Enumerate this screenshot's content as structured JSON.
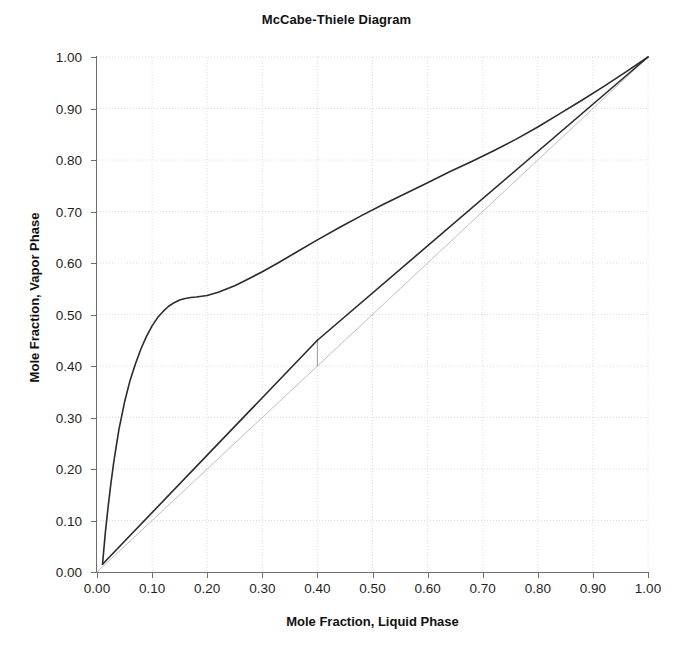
{
  "chart_data": {
    "type": "line",
    "title": "McCabe-Thiele Diagram",
    "xlabel": "Mole Fraction, Liquid Phase",
    "ylabel": "Mole Fraction, Vapor Phase",
    "xlim": [
      0.0,
      1.0
    ],
    "ylim": [
      0.0,
      1.0
    ],
    "xticks": [
      "0.00",
      "0.10",
      "0.20",
      "0.30",
      "0.40",
      "0.50",
      "0.60",
      "0.70",
      "0.80",
      "0.90",
      "1.00"
    ],
    "yticks": [
      "0.00",
      "0.10",
      "0.20",
      "0.30",
      "0.40",
      "0.50",
      "0.60",
      "0.70",
      "0.80",
      "0.90",
      "1.00"
    ],
    "xtick_values": [
      0.0,
      0.1,
      0.2,
      0.3,
      0.4,
      0.5,
      0.6,
      0.7,
      0.8,
      0.9,
      1.0
    ],
    "ytick_values": [
      0.0,
      0.1,
      0.2,
      0.3,
      0.4,
      0.5,
      0.6,
      0.7,
      0.8,
      0.9,
      1.0
    ],
    "grid": true,
    "grid_style": "dotted",
    "grid_color": "#dcdcdc",
    "legend": "none",
    "axis_color": "#6e6e6e",
    "series": [
      {
        "name": "equilibrium-curve",
        "role": "vapor-liquid equilibrium curve",
        "color": "#2b2b2b",
        "width": 1.6,
        "points": [
          [
            0.01,
            0.015
          ],
          [
            0.015,
            0.075
          ],
          [
            0.02,
            0.125
          ],
          [
            0.025,
            0.17
          ],
          [
            0.03,
            0.21
          ],
          [
            0.035,
            0.245
          ],
          [
            0.04,
            0.278
          ],
          [
            0.05,
            0.33
          ],
          [
            0.06,
            0.372
          ],
          [
            0.07,
            0.405
          ],
          [
            0.08,
            0.434
          ],
          [
            0.09,
            0.458
          ],
          [
            0.1,
            0.478
          ],
          [
            0.11,
            0.494
          ],
          [
            0.12,
            0.506
          ],
          [
            0.13,
            0.516
          ],
          [
            0.14,
            0.523
          ],
          [
            0.15,
            0.528
          ],
          [
            0.16,
            0.531
          ],
          [
            0.17,
            0.533
          ],
          [
            0.18,
            0.534
          ],
          [
            0.2,
            0.537
          ],
          [
            0.22,
            0.543
          ],
          [
            0.25,
            0.556
          ],
          [
            0.28,
            0.572
          ],
          [
            0.3,
            0.583
          ],
          [
            0.33,
            0.601
          ],
          [
            0.36,
            0.62
          ],
          [
            0.4,
            0.645
          ],
          [
            0.44,
            0.669
          ],
          [
            0.48,
            0.692
          ],
          [
            0.52,
            0.714
          ],
          [
            0.56,
            0.735
          ],
          [
            0.6,
            0.756
          ],
          [
            0.64,
            0.777
          ],
          [
            0.68,
            0.797
          ],
          [
            0.72,
            0.818
          ],
          [
            0.76,
            0.84
          ],
          [
            0.8,
            0.864
          ],
          [
            0.84,
            0.89
          ],
          [
            0.88,
            0.916
          ],
          [
            0.92,
            0.943
          ],
          [
            0.96,
            0.971
          ],
          [
            1.0,
            1.0
          ]
        ]
      },
      {
        "name": "operating-line-rectifying",
        "role": "rectifying section operating line",
        "color": "#2b2b2b",
        "width": 1.6,
        "points": [
          [
            0.4,
            0.45
          ],
          [
            1.0,
            1.0
          ]
        ]
      },
      {
        "name": "operating-line-stripping",
        "role": "stripping section operating line",
        "color": "#2b2b2b",
        "width": 1.6,
        "points": [
          [
            0.01,
            0.015
          ],
          [
            0.4,
            0.45
          ]
        ]
      },
      {
        "name": "q-line",
        "role": "feed q-line segment",
        "color": "#9a9a9a",
        "width": 1.0,
        "points": [
          [
            0.4,
            0.4
          ],
          [
            0.4,
            0.45
          ]
        ]
      },
      {
        "name": "diagonal-45",
        "role": "y = x forty-five degree reference line",
        "color": "#bfbfbf",
        "width": 1.0,
        "points": [
          [
            0.0,
            0.0
          ],
          [
            1.0,
            1.0
          ]
        ]
      }
    ],
    "annotations": {
      "feed_composition": 0.4,
      "pinch_region": 0.8
    }
  }
}
